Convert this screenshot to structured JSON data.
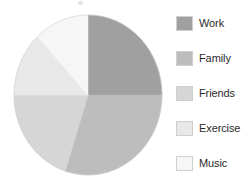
{
  "chart_data": {
    "type": "pie",
    "title": "",
    "subtitle": "",
    "xlabel": "",
    "ylabel": "",
    "legend_position": "right",
    "grid": false,
    "start_angle_deg": 0,
    "direction": "clockwise",
    "categories": [
      "Work",
      "Family",
      "Friends",
      "Exercise",
      "Music"
    ],
    "values": [
      25,
      30,
      20,
      13,
      12
    ],
    "units": "percent",
    "slices": [
      {
        "label": "Work",
        "value": 25,
        "percent": 25,
        "color": "#a0a0a0",
        "start_deg": 0,
        "end_deg": 90
      },
      {
        "label": "Family",
        "value": 30,
        "percent": 30,
        "color": "#bdbdbd",
        "start_deg": 90,
        "end_deg": 198
      },
      {
        "label": "Friends",
        "value": 20,
        "percent": 20,
        "color": "#d6d6d6",
        "start_deg": 198,
        "end_deg": 270
      },
      {
        "label": "Exercise",
        "value": 13,
        "percent": 13,
        "color": "#e8e8e8",
        "start_deg": 270,
        "end_deg": 317
      },
      {
        "label": "Music",
        "value": 12,
        "percent": 12,
        "color": "#f6f6f6",
        "start_deg": 317,
        "end_deg": 360
      }
    ]
  },
  "legend": {
    "items": [
      {
        "label": "Work",
        "color": "#a0a0a0"
      },
      {
        "label": "Family",
        "color": "#bdbdbd"
      },
      {
        "label": "Friends",
        "color": "#d6d6d6"
      },
      {
        "label": "Exercise",
        "color": "#e8e8e8"
      },
      {
        "label": "Music",
        "color": "#f6f6f6"
      }
    ]
  },
  "colors": {
    "background": "#ffffff",
    "text": "#2b2b2b",
    "outline": "#cfcfcf"
  }
}
